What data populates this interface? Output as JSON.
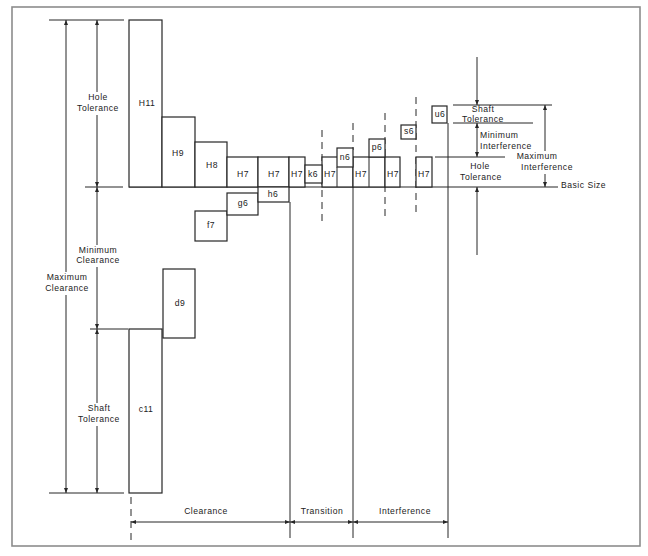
{
  "colors": {
    "line": "#262626",
    "frame": "#8c8c8c",
    "background": "#ffffff"
  },
  "hole_zones": [
    "H11",
    "H9",
    "H8",
    "H7",
    "H7",
    "H7",
    "H7",
    "H7",
    "H7",
    "H7"
  ],
  "shaft_zones": [
    "c11",
    "d9",
    "f7",
    "g6",
    "h6",
    "k6",
    "n6",
    "p6",
    "s6",
    "u6"
  ],
  "left_dimensions": {
    "hole_tolerance": {
      "line1": "Hole",
      "line2": "Tolerance"
    },
    "minimum_clearance": {
      "line1": "Minimum",
      "line2": "Clearance"
    },
    "maximum_clearance": {
      "line1": "Maximum",
      "line2": "Clearance"
    },
    "shaft_tolerance": {
      "line1": "Shaft",
      "line2": "Tolerance"
    }
  },
  "right_dimensions": {
    "shaft_tolerance": {
      "line1": "Shaft",
      "line2": "Tolerance"
    },
    "minimum_interference": {
      "line1": "Minimum",
      "line2": "Interference"
    },
    "hole_tolerance": {
      "line1": "Hole",
      "line2": "Tolerance"
    },
    "maximum_interference": {
      "line1": "Maximum",
      "line2": "Interference"
    },
    "basic_size": "Basic Size"
  },
  "fit_zones": [
    "Clearance",
    "Transition",
    "Interference"
  ]
}
